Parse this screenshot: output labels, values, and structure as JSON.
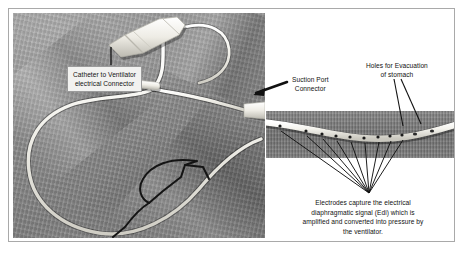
{
  "figure": {
    "border_color": "#a9a9a9",
    "background": "#ffffff"
  },
  "photo": {
    "description": "Photograph of a coiled NAVA feeding catheter lying on gray fabric",
    "fabric_color": "#8b8b8b",
    "tube_color": "#f0efe9"
  },
  "inset": {
    "description": "Magnified view of the distal catheter tip showing electrode array and evacuation holes",
    "background_color": "#7d7d7d"
  },
  "labels": {
    "connector": {
      "line1": "Catheter to Ventilator",
      "line2": "electrical Connector",
      "boxed": true
    },
    "suction": {
      "line1": "Suction Port",
      "line2": "Connector",
      "boxed": false
    },
    "holes": {
      "line1": "Holes for Evacuation",
      "line2": "of stomach",
      "boxed": false
    },
    "electrodes": {
      "line1": "Electrodes capture the electrical",
      "line2": "diaphragmatic signal (Edi) which is",
      "line3": "amplified and converted into pressure by",
      "line4": "the ventilator.",
      "boxed": false
    }
  },
  "leaders": {
    "color": "#111111",
    "fan_count": 9,
    "holes_count": 2
  }
}
